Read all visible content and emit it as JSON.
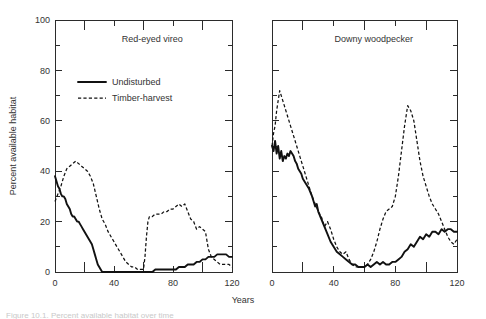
{
  "figure": {
    "xlabel": "Years",
    "ylabel": "Percent available habitat",
    "caption": "Figure 10.1. Percent available habitat over time"
  },
  "legend": {
    "entries": [
      {
        "label": "Undisturbed",
        "style": "solid"
      },
      {
        "label": "Timber-harvest",
        "style": "dashed"
      }
    ]
  },
  "chart_data": [
    {
      "type": "line",
      "title": "Red-eyed vireo",
      "xlabel": "Years",
      "ylabel": "Percent available habitat",
      "xlim": [
        0,
        120
      ],
      "ylim": [
        0,
        100
      ],
      "xticks": [
        0,
        40,
        80,
        120
      ],
      "xticks_minor": [
        20,
        60,
        100
      ],
      "yticks": [
        0,
        20,
        40,
        60,
        80,
        100
      ],
      "yticks_minor": [
        10,
        30,
        50,
        70,
        90
      ],
      "grid": false,
      "legend_position": "upper-left",
      "series": [
        {
          "name": "Undisturbed",
          "style": "solid",
          "x": [
            0,
            1,
            2,
            3,
            4,
            5,
            6,
            7,
            8,
            9,
            10,
            11,
            12,
            13,
            14,
            15,
            16,
            17,
            18,
            19,
            20,
            21,
            22,
            23,
            24,
            25,
            26,
            27,
            28,
            29,
            30,
            31,
            32,
            34,
            40,
            50,
            60,
            62,
            64,
            66,
            68,
            70,
            74,
            78,
            80,
            82,
            84,
            86,
            88,
            90,
            92,
            94,
            96,
            98,
            100,
            102,
            104,
            106,
            108,
            110,
            112,
            114,
            116,
            118,
            120
          ],
          "y": [
            38,
            36,
            34,
            33,
            31,
            30,
            30,
            29,
            27,
            26,
            25,
            23,
            22,
            22,
            21,
            20,
            20,
            19,
            18,
            17,
            16,
            15,
            14,
            13,
            12,
            11,
            9,
            7,
            5,
            3,
            2,
            1,
            0,
            0,
            0,
            0,
            0,
            0,
            0,
            0,
            1,
            1,
            1,
            1,
            1,
            1,
            2,
            2,
            2,
            3,
            3,
            3,
            4,
            4,
            5,
            5,
            6,
            6,
            6,
            7,
            7,
            7,
            7,
            6,
            6
          ]
        },
        {
          "name": "Timber-harvest",
          "style": "dashed",
          "x": [
            0,
            2,
            4,
            6,
            8,
            10,
            12,
            14,
            16,
            18,
            20,
            22,
            24,
            26,
            28,
            30,
            32,
            34,
            36,
            38,
            40,
            42,
            44,
            46,
            48,
            50,
            52,
            54,
            56,
            58,
            60,
            61,
            62,
            63,
            64,
            66,
            68,
            70,
            72,
            74,
            76,
            78,
            80,
            82,
            84,
            86,
            88,
            90,
            92,
            94,
            96,
            98,
            100,
            102,
            104,
            106,
            108,
            110,
            112,
            114,
            116,
            118,
            120
          ],
          "y": [
            28,
            31,
            34,
            38,
            41,
            42,
            43,
            44,
            43,
            42,
            41,
            40,
            38,
            35,
            30,
            25,
            21,
            19,
            16,
            14,
            12,
            10,
            8,
            6,
            4,
            3,
            2,
            2,
            1,
            1,
            1,
            6,
            14,
            20,
            22,
            22,
            23,
            23,
            23,
            24,
            24,
            25,
            25,
            26,
            27,
            26,
            27,
            24,
            21,
            20,
            17,
            18,
            17,
            16,
            9,
            6,
            5,
            4,
            3,
            3,
            3,
            3,
            2
          ]
        }
      ]
    },
    {
      "type": "line",
      "title": "Downy woodpecker",
      "xlabel": "Years",
      "ylabel": "Percent available habitat",
      "xlim": [
        0,
        120
      ],
      "ylim": [
        0,
        100
      ],
      "xticks": [
        0,
        40,
        80,
        120
      ],
      "xticks_minor": [
        20,
        60,
        100
      ],
      "yticks": [
        0,
        20,
        40,
        60,
        80,
        100
      ],
      "yticks_minor": [
        10,
        30,
        50,
        70,
        90
      ],
      "grid": false,
      "legend_position": "none",
      "series": [
        {
          "name": "Undisturbed",
          "style": "solid",
          "x": [
            0,
            1,
            2,
            3,
            4,
            5,
            6,
            7,
            8,
            9,
            10,
            11,
            12,
            13,
            14,
            15,
            16,
            17,
            18,
            19,
            20,
            22,
            24,
            26,
            27,
            28,
            29,
            30,
            32,
            34,
            36,
            38,
            40,
            42,
            44,
            46,
            48,
            50,
            52,
            54,
            56,
            58,
            60,
            62,
            64,
            66,
            68,
            70,
            72,
            74,
            76,
            78,
            80,
            82,
            84,
            86,
            88,
            90,
            92,
            94,
            96,
            98,
            100,
            102,
            104,
            106,
            108,
            110,
            112,
            114,
            116,
            118,
            120
          ],
          "y": [
            50,
            48,
            52,
            47,
            50,
            45,
            48,
            44,
            46,
            45,
            47,
            46,
            48,
            47,
            46,
            44,
            43,
            41,
            40,
            39,
            37,
            35,
            33,
            30,
            28,
            26,
            27,
            24,
            21,
            18,
            15,
            12,
            10,
            8,
            7,
            6,
            5,
            4,
            3,
            3,
            2,
            2,
            2,
            3,
            2,
            3,
            4,
            3,
            4,
            3,
            3,
            4,
            4,
            5,
            6,
            8,
            9,
            11,
            10,
            12,
            14,
            13,
            15,
            14,
            16,
            16,
            15,
            17,
            16,
            17,
            17,
            16,
            16
          ]
        },
        {
          "name": "Timber-harvest",
          "style": "dashed",
          "x": [
            0,
            1,
            2,
            3,
            4,
            5,
            6,
            7,
            8,
            10,
            12,
            14,
            16,
            18,
            20,
            22,
            24,
            26,
            28,
            30,
            32,
            34,
            36,
            38,
            40,
            42,
            44,
            46,
            48,
            50,
            52,
            54,
            56,
            58,
            60,
            62,
            64,
            66,
            68,
            70,
            72,
            74,
            76,
            78,
            80,
            82,
            84,
            86,
            88,
            90,
            92,
            94,
            96,
            98,
            100,
            102,
            104,
            106,
            108,
            110,
            112,
            114,
            116,
            118,
            120
          ],
          "y": [
            50,
            55,
            58,
            64,
            68,
            72,
            70,
            68,
            66,
            62,
            58,
            54,
            50,
            46,
            42,
            38,
            34,
            30,
            27,
            24,
            22,
            18,
            20,
            17,
            13,
            10,
            8,
            7,
            8,
            5,
            3,
            2,
            2,
            2,
            2,
            3,
            5,
            8,
            12,
            17,
            21,
            24,
            25,
            26,
            30,
            38,
            48,
            58,
            66,
            64,
            60,
            52,
            44,
            38,
            34,
            30,
            27,
            25,
            23,
            20,
            17,
            14,
            12,
            11,
            13
          ]
        }
      ]
    }
  ]
}
